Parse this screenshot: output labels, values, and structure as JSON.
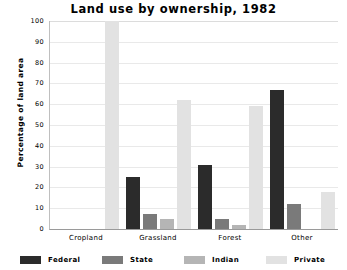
{
  "chart_data": {
    "type": "bar",
    "title": "Land use by ownership, 1982",
    "xlabel": "",
    "ylabel": "Percentage of land area",
    "ylim": [
      0,
      100
    ],
    "yticks": [
      0,
      10,
      20,
      30,
      40,
      50,
      60,
      70,
      80,
      90,
      100
    ],
    "ytick_labels": [
      "0",
      "10",
      "20",
      "30",
      "40",
      "50",
      "60",
      "70",
      "80",
      "90",
      "100"
    ],
    "grid": true,
    "legend_position": "bottom",
    "categories": [
      "Cropland",
      "Grassland",
      "Forest",
      "Other"
    ],
    "series": [
      {
        "name": "Federal",
        "color": "#2b2b2b",
        "values": [
          0,
          25,
          31,
          67
        ]
      },
      {
        "name": "State",
        "color": "#7a7a7a",
        "values": [
          0,
          7,
          5,
          12
        ]
      },
      {
        "name": "Indian",
        "color": "#b5b5b5",
        "values": [
          0,
          5,
          2,
          0
        ]
      },
      {
        "name": "Private",
        "color": "#e2e2e2",
        "values": [
          100,
          62,
          59,
          18
        ]
      }
    ]
  },
  "legend": {
    "items": [
      {
        "label": "Federal",
        "color": "#2b2b2b"
      },
      {
        "label": "State",
        "color": "#7a7a7a"
      },
      {
        "label": "Indian",
        "color": "#b5b5b5"
      },
      {
        "label": "Private",
        "color": "#e2e2e2"
      }
    ]
  }
}
